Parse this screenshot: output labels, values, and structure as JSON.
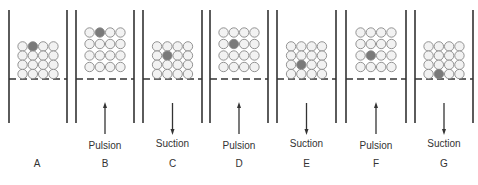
{
  "figure": {
    "colors": {
      "wall": "#333333",
      "particle_fill": "#f2f2f2",
      "particle_stroke": "#888888",
      "tracer_fill": "#7a7a7a",
      "screen": "#333333",
      "arrow": "#333333"
    },
    "panels": [
      {
        "id": "A",
        "x": 9,
        "w": 58,
        "stroke": "",
        "bed": "compact",
        "tracer": [
          0,
          1
        ],
        "arrow": "none"
      },
      {
        "id": "B",
        "x": 76,
        "w": 58,
        "stroke": "Pulsion",
        "bed": "expanded",
        "tracer": [
          0,
          1
        ],
        "arrow": "up"
      },
      {
        "id": "C",
        "x": 143,
        "w": 59,
        "stroke": "Suction",
        "bed": "compact",
        "tracer": [
          1,
          1
        ],
        "arrow": "down"
      },
      {
        "id": "D",
        "x": 210,
        "w": 58,
        "stroke": "Pulsion",
        "bed": "expanded",
        "tracer": [
          1,
          1
        ],
        "arrow": "up"
      },
      {
        "id": "E",
        "x": 277,
        "w": 59,
        "stroke": "Suction",
        "bed": "compact",
        "tracer": [
          2,
          1
        ],
        "arrow": "down"
      },
      {
        "id": "F",
        "x": 346,
        "w": 60,
        "stroke": "Pulsion",
        "bed": "expanded",
        "tracer": [
          2,
          1
        ],
        "arrow": "up"
      },
      {
        "id": "G",
        "x": 415,
        "w": 58,
        "stroke": "Suction",
        "bed": "compact",
        "tracer": [
          3,
          1
        ],
        "arrow": "down"
      }
    ]
  }
}
